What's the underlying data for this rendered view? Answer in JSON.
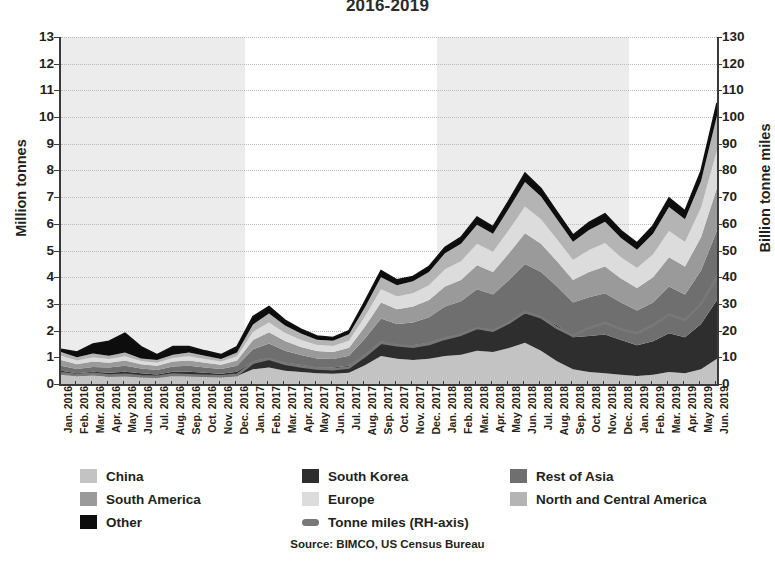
{
  "title": "2016-2019",
  "source": "Source: BIMCO, US Census Bureau",
  "axes": {
    "left_title": "Million tonnes",
    "right_title": "Billion tonne miles",
    "left_ticks": [
      "0",
      "1",
      "2",
      "3",
      "4",
      "5",
      "6",
      "7",
      "8",
      "9",
      "10",
      "11",
      "12",
      "13"
    ],
    "right_ticks": [
      "0",
      "10",
      "20",
      "30",
      "40",
      "50",
      "60",
      "70",
      "80",
      "90",
      "100",
      "110",
      "120",
      "130"
    ]
  },
  "legend": {
    "items": [
      {
        "label": "China",
        "color": "#c3c3c3",
        "type": "area"
      },
      {
        "label": "South Korea",
        "color": "#2e2e2e",
        "type": "area"
      },
      {
        "label": "Rest of Asia",
        "color": "#6f6f6f",
        "type": "area"
      },
      {
        "label": "South America",
        "color": "#9a9a9a",
        "type": "area"
      },
      {
        "label": "Europe",
        "color": "#dcdcdc",
        "type": "area"
      },
      {
        "label": "North and Central America",
        "color": "#b4b4b4",
        "type": "area"
      },
      {
        "label": "Other",
        "color": "#0d0d0d",
        "type": "area"
      },
      {
        "label": "Tonne miles (RH-axis)",
        "color": "#787878",
        "type": "line"
      }
    ]
  },
  "chart_data": {
    "type": "area",
    "title": "2016-2019",
    "xlabel": "",
    "ylabel": "Million tonnes",
    "y2label": "Billion tonne miles",
    "ylim": [
      0,
      13
    ],
    "y2lim": [
      0,
      130
    ],
    "grid": true,
    "legend_position": "bottom",
    "stacked": true,
    "year_bands_shaded": [
      "2016",
      "2018"
    ],
    "categories": [
      "Jan. 2016",
      "Feb. 2016",
      "Mar. 2016",
      "Apr. 2016",
      "May 2016",
      "Jun. 2016",
      "Jul. 2016",
      "Aug. 2016",
      "Sep. 2016",
      "Oct. 2016",
      "Nov. 2016",
      "Dec. 2016",
      "Jan. 2017",
      "Feb. 2017",
      "Mar. 2017",
      "Apr. 2017",
      "May 2017",
      "Jun. 2017",
      "Jul. 2017",
      "Aug. 2017",
      "Sep. 2017",
      "Oct. 2017",
      "Nov. 2017",
      "Dec. 2017",
      "Jan. 2018",
      "Feb. 2018",
      "Mar. 2018",
      "Apr. 2018",
      "May 2018",
      "Jun. 2018",
      "Jul. 2018",
      "Aug. 2018",
      "Sep. 2018",
      "Oct. 2018",
      "Nov. 2018",
      "Dec. 2018",
      "Jan. 2019",
      "Feb. 2019",
      "Mar. 2019",
      "Apr. 2019",
      "May 2019",
      "Jun. 2019"
    ],
    "series": [
      {
        "name": "China",
        "color": "#c3c3c3",
        "values": [
          0.38,
          0.3,
          0.34,
          0.28,
          0.3,
          0.26,
          0.24,
          0.32,
          0.3,
          0.28,
          0.26,
          0.3,
          0.55,
          0.62,
          0.5,
          0.45,
          0.4,
          0.38,
          0.42,
          0.7,
          1.05,
          0.95,
          0.9,
          0.95,
          1.05,
          1.1,
          1.25,
          1.2,
          1.35,
          1.55,
          1.25,
          0.85,
          0.55,
          0.45,
          0.4,
          0.35,
          0.3,
          0.35,
          0.45,
          0.4,
          0.55,
          0.95
        ]
      },
      {
        "name": "South Korea",
        "color": "#2e2e2e",
        "values": [
          0.12,
          0.1,
          0.12,
          0.14,
          0.16,
          0.14,
          0.12,
          0.14,
          0.16,
          0.14,
          0.12,
          0.16,
          0.3,
          0.35,
          0.3,
          0.26,
          0.22,
          0.24,
          0.26,
          0.4,
          0.55,
          0.5,
          0.55,
          0.6,
          0.7,
          0.75,
          0.85,
          0.8,
          0.95,
          1.1,
          1.25,
          1.35,
          1.2,
          1.35,
          1.45,
          1.3,
          1.15,
          1.25,
          1.45,
          1.35,
          1.7,
          2.2
        ]
      },
      {
        "name": "Rest of Asia",
        "color": "#6f6f6f",
        "values": [
          0.18,
          0.16,
          0.18,
          0.2,
          0.22,
          0.18,
          0.16,
          0.2,
          0.22,
          0.2,
          0.18,
          0.22,
          0.45,
          0.55,
          0.45,
          0.38,
          0.34,
          0.32,
          0.38,
          0.6,
          0.85,
          0.8,
          0.85,
          0.95,
          1.15,
          1.25,
          1.45,
          1.35,
          1.6,
          1.85,
          1.7,
          1.45,
          1.3,
          1.45,
          1.55,
          1.4,
          1.3,
          1.45,
          1.75,
          1.6,
          2.0,
          2.6
        ]
      },
      {
        "name": "South America",
        "color": "#9a9a9a",
        "values": [
          0.22,
          0.18,
          0.2,
          0.18,
          0.2,
          0.16,
          0.16,
          0.18,
          0.2,
          0.18,
          0.16,
          0.2,
          0.35,
          0.42,
          0.36,
          0.3,
          0.28,
          0.26,
          0.3,
          0.45,
          0.6,
          0.55,
          0.6,
          0.65,
          0.75,
          0.8,
          0.9,
          0.85,
          1.0,
          1.15,
          1.05,
          0.95,
          0.85,
          0.95,
          1.0,
          0.9,
          0.85,
          0.95,
          1.1,
          1.05,
          1.25,
          1.6
        ]
      },
      {
        "name": "Europe",
        "color": "#dcdcdc",
        "values": [
          0.16,
          0.14,
          0.16,
          0.14,
          0.16,
          0.12,
          0.12,
          0.14,
          0.16,
          0.14,
          0.12,
          0.16,
          0.3,
          0.36,
          0.3,
          0.26,
          0.22,
          0.22,
          0.26,
          0.38,
          0.5,
          0.48,
          0.5,
          0.55,
          0.65,
          0.7,
          0.8,
          0.75,
          0.88,
          1.0,
          0.92,
          0.82,
          0.75,
          0.82,
          0.88,
          0.8,
          0.75,
          0.85,
          0.98,
          0.92,
          1.1,
          1.4
        ]
      },
      {
        "name": "North and Central America",
        "color": "#b4b4b4",
        "values": [
          0.14,
          0.12,
          0.14,
          0.12,
          0.14,
          0.1,
          0.1,
          0.12,
          0.14,
          0.12,
          0.1,
          0.14,
          0.28,
          0.34,
          0.28,
          0.24,
          0.2,
          0.2,
          0.24,
          0.35,
          0.45,
          0.42,
          0.45,
          0.5,
          0.6,
          0.65,
          0.72,
          0.68,
          0.8,
          0.92,
          0.85,
          0.75,
          0.68,
          0.75,
          0.8,
          0.72,
          0.68,
          0.78,
          0.9,
          0.85,
          1.0,
          1.3
        ]
      },
      {
        "name": "Other",
        "color": "#0d0d0d",
        "values": [
          0.1,
          0.2,
          0.36,
          0.54,
          0.72,
          0.44,
          0.2,
          0.3,
          0.22,
          0.18,
          0.16,
          0.22,
          0.3,
          0.26,
          0.2,
          0.16,
          0.14,
          0.12,
          0.14,
          0.22,
          0.25,
          0.2,
          0.18,
          0.2,
          0.22,
          0.25,
          0.28,
          0.26,
          0.3,
          0.33,
          0.3,
          0.28,
          0.25,
          0.28,
          0.3,
          0.28,
          0.26,
          0.3,
          0.34,
          0.32,
          0.38,
          0.48
        ]
      }
    ],
    "line_series": {
      "name": "Tonne miles (RH-axis)",
      "color": "#787878",
      "axis": "right",
      "values": [
        4.0,
        3.4,
        3.8,
        3.2,
        3.4,
        2.9,
        2.7,
        3.5,
        3.3,
        3.1,
        2.9,
        3.4,
        8.0,
        9.5,
        7.6,
        6.6,
        5.8,
        5.5,
        6.2,
        10.5,
        15.5,
        14.5,
        14.0,
        15.0,
        17.0,
        18.5,
        21.0,
        20.0,
        23.0,
        27.0,
        25.0,
        21.0,
        18.0,
        21.0,
        23.0,
        20.5,
        19.0,
        22.0,
        26.0,
        24.0,
        30.0,
        40.0
      ]
    }
  }
}
